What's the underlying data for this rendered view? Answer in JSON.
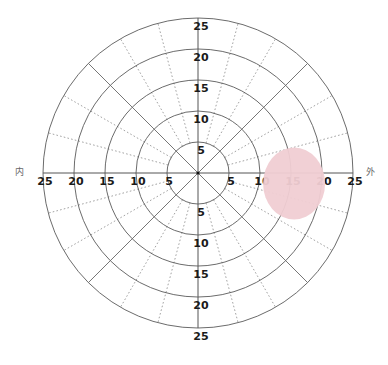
{
  "chart_data": {
    "type": "polar",
    "title": "",
    "radial_unit": "degrees",
    "radial_max": 25,
    "radial_ticks": [
      5,
      10,
      15,
      20,
      25
    ],
    "solid_radials_deg": [
      0,
      45,
      90,
      135,
      180,
      225,
      270,
      315
    ],
    "dotted_radials_deg": [
      15,
      30,
      60,
      75,
      105,
      120,
      150,
      165,
      195,
      210,
      240,
      255,
      285,
      300,
      330,
      345
    ],
    "dotted_radials_start": 5,
    "axis_labels": {
      "left": "内",
      "right": "外"
    },
    "tick_labels": {
      "top": [
        "5",
        "10",
        "15",
        "20",
        "25"
      ],
      "bottom": [
        "5",
        "10",
        "15",
        "20",
        "25"
      ],
      "left": [
        "5",
        "10",
        "15",
        "20",
        "25"
      ],
      "right": [
        "5",
        "10",
        "15",
        "20",
        "25"
      ]
    },
    "regions": [
      {
        "name": "blind-spot",
        "shape": "ellipse",
        "center_x_deg": 15.5,
        "center_y_deg": -1.7,
        "radius_x_deg": 10.0,
        "radius_y_deg": 11.6,
        "color": "#F0CDD3"
      }
    ],
    "grid": true,
    "legend": null
  },
  "layout": {
    "cx": 198,
    "cy": 173,
    "px_per_unit": 6.2
  },
  "colors": {
    "ring": "#5a5a5a",
    "axis": "#555555",
    "dotted": "#8a8a8a",
    "blind_spot": "#F0CDD3",
    "text": "#1a1a1a"
  }
}
